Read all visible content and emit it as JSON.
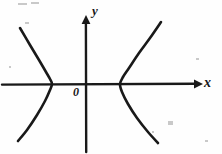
{
  "figure": {
    "kind": "line",
    "background_color": "#fefefe",
    "ink_color": "#191919"
  },
  "labels": {
    "x_axis": "x",
    "y_axis": "y",
    "origin": "0"
  },
  "chart_data": {
    "type": "line",
    "title": "",
    "subtitle": "",
    "xlabel": "x",
    "ylabel": "y",
    "grid": false,
    "legend": null,
    "axes": {
      "origin_label": "0",
      "origin_px": [
        86,
        84
      ],
      "x_axis_px": {
        "y": 84,
        "x_start": 2,
        "x_end": 200,
        "arrow": "right"
      },
      "y_axis_px": {
        "x": 86,
        "y_start": 16,
        "y_end": 152,
        "arrow": "up"
      },
      "xlim": [
        -2.5,
        2.9
      ],
      "ylim": [
        -1.8,
        1.8
      ]
    },
    "annotations": [
      {
        "text": "x",
        "px": [
          206,
          83
        ],
        "role": "axis-label"
      },
      {
        "text": "y",
        "px": [
          94,
          11
        ],
        "role": "axis-label"
      },
      {
        "text": "0",
        "px": [
          77,
          92
        ],
        "role": "origin-label"
      }
    ],
    "series": [
      {
        "name": "left branch",
        "opens": "left",
        "vertex_px": [
          52,
          84
        ],
        "points_px": [
          [
            20,
            28
          ],
          [
            30,
            45
          ],
          [
            39,
            60
          ],
          [
            46,
            72
          ],
          [
            50,
            79
          ],
          [
            52,
            84
          ],
          [
            50,
            90
          ],
          [
            45,
            101
          ],
          [
            37,
            115
          ],
          [
            27,
            130
          ],
          [
            18,
            141
          ]
        ]
      },
      {
        "name": "right branch",
        "opens": "right",
        "vertex_px": [
          120,
          84
        ],
        "points_px": [
          [
            161,
            22
          ],
          [
            150,
            38
          ],
          [
            139,
            53
          ],
          [
            129,
            68
          ],
          [
            123,
            77
          ],
          [
            120,
            84
          ],
          [
            122,
            92
          ],
          [
            128,
            104
          ],
          [
            137,
            118
          ],
          [
            148,
            132
          ],
          [
            158,
            143
          ]
        ]
      }
    ],
    "equation_implied": "x^2/a^2 - y^2/b^2 = 1"
  },
  "specks": [
    {
      "px": [
        18,
        3
      ],
      "w": 9,
      "h": 2
    },
    {
      "px": [
        31,
        2
      ],
      "w": 8,
      "h": 2
    },
    {
      "px": [
        25,
        22
      ],
      "w": 4,
      "h": 2
    },
    {
      "px": [
        168,
        121
      ],
      "w": 5,
      "h": 4
    },
    {
      "px": [
        152,
        131
      ],
      "w": 2,
      "h": 2
    },
    {
      "px": [
        196,
        58
      ],
      "w": 3,
      "h": 2
    },
    {
      "px": [
        9,
        66
      ],
      "w": 2,
      "h": 2
    },
    {
      "px": [
        205,
        140
      ],
      "w": 3,
      "h": 2
    }
  ]
}
